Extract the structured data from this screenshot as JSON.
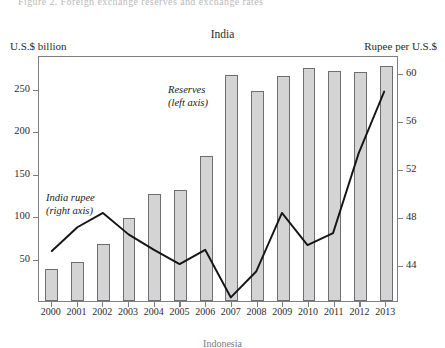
{
  "clipped_header": "Figure 2. Foreign exchange reserves and exchange rates",
  "left_axis_caption": "U.S.$ billion",
  "right_axis_caption": "Rupee per U.S.$",
  "footer_clipped": "Indonesia",
  "annotations": {
    "reserves": "Reserves",
    "reserves_sub": "(left axis)",
    "rupee": "India rupee",
    "rupee_sub": "(right axis)"
  },
  "chart_data": {
    "type": "bar",
    "title": "India",
    "xlabel": "",
    "ylabel": "U.S.$ billion",
    "y2label": "Rupee per U.S.$",
    "grid": false,
    "legend": "inline-annotations",
    "categories": [
      "2000",
      "2001",
      "2002",
      "2003",
      "2004",
      "2005",
      "2006",
      "2007",
      "2008",
      "2009",
      "2010",
      "2011",
      "2012",
      "2013"
    ],
    "ylim": [
      0,
      290
    ],
    "yticks": [
      50,
      100,
      150,
      200,
      250
    ],
    "y2lim": [
      41,
      61.5
    ],
    "y2ticks": [
      44,
      48,
      52,
      56,
      60
    ],
    "series": [
      {
        "name": "Reserves",
        "axis": "left",
        "type": "bar",
        "unit": "U.S.$ billion",
        "values": [
          38,
          46,
          67,
          98,
          126,
          131,
          171,
          266,
          247,
          265,
          275,
          271,
          270,
          277
        ]
      },
      {
        "name": "India rupee",
        "axis": "right",
        "type": "line",
        "unit": "Rupee per U.S.$",
        "values": [
          45.2,
          47.2,
          48.4,
          46.6,
          45.3,
          44.1,
          45.3,
          41.3,
          43.5,
          48.4,
          45.7,
          46.7,
          53.4,
          58.6
        ]
      }
    ]
  }
}
